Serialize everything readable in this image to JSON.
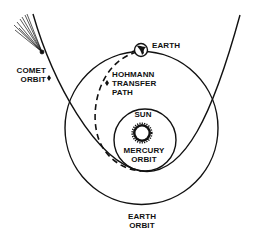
{
  "diagram": {
    "type": "orbital-transfer-illustration",
    "colors": {
      "ink": "#111111",
      "background": "#ffffff"
    },
    "labels": {
      "earth": "EARTH",
      "hohmann_line1": "HOHMANN",
      "hohmann_line2": "TRANSFER",
      "hohmann_line3": "PATH",
      "sun": "SUN",
      "mercury_line1": "MERCURY",
      "mercury_line2": "ORBIT",
      "comet_line1": "COMET",
      "comet_line2": "ORBIT",
      "earth_orbit_line1": "EARTH",
      "earth_orbit_line2": "ORBIT"
    },
    "elements": [
      {
        "name": "earth-orbit",
        "shape": "circle"
      },
      {
        "name": "mercury-orbit",
        "shape": "circle"
      },
      {
        "name": "sun",
        "shape": "star"
      },
      {
        "name": "earth",
        "shape": "globe"
      },
      {
        "name": "hohmann-transfer-path",
        "shape": "dashed-arc"
      },
      {
        "name": "comet-orbit",
        "shape": "parabola"
      },
      {
        "name": "comet",
        "shape": "comet-with-tail"
      }
    ]
  }
}
